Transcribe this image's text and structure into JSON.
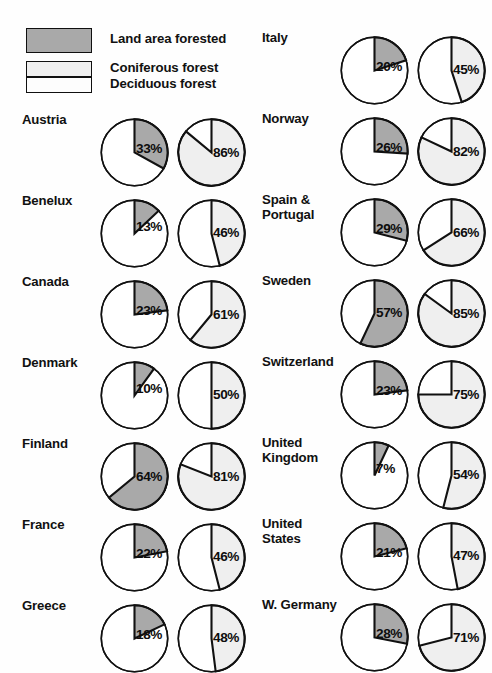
{
  "legend": {
    "items": [
      {
        "key": "land_area_forested",
        "label": "Land area forested",
        "swatch": "shaded-gray",
        "color": "#a9a9a9"
      },
      {
        "key": "coniferous_forest",
        "label": "Coniferous forest",
        "swatch": "light-gray",
        "color": "#efefef"
      },
      {
        "key": "deciduous_forest",
        "label": "Deciduous forest",
        "swatch": "white",
        "color": "#ffffff"
      }
    ]
  },
  "chart_data": {
    "type": "pie",
    "title": "",
    "series": [
      {
        "name": "Land area forested",
        "color": "#a9a9a9"
      },
      {
        "name": "Coniferous forest",
        "color": "#efefef"
      },
      {
        "name": "Deciduous forest",
        "color": "#ffffff"
      }
    ],
    "legend_position": "top-left",
    "categories": [
      "Austria",
      "Benelux",
      "Canada",
      "Denmark",
      "Finland",
      "France",
      "Greece",
      "Italy",
      "Norway",
      "Spain & Portugal",
      "Sweden",
      "Switzerland",
      "United Kingdom",
      "United States",
      "W. Germany"
    ],
    "land_area_forested_pct": [
      33,
      13,
      23,
      10,
      64,
      22,
      18,
      20,
      26,
      29,
      57,
      23,
      7,
      21,
      28
    ],
    "coniferous_forest_pct": [
      86,
      46,
      61,
      50,
      81,
      46,
      48,
      45,
      82,
      66,
      85,
      75,
      54,
      47,
      71
    ]
  },
  "columns": [
    {
      "column": "left",
      "rows": [
        {
          "label": "Austria",
          "forested": "33%",
          "forested_value": 33,
          "coniferous": "86%",
          "coniferous_value": 86
        },
        {
          "label": "Benelux",
          "forested": "13%",
          "forested_value": 13,
          "coniferous": "46%",
          "coniferous_value": 46
        },
        {
          "label": "Canada",
          "forested": "23%",
          "forested_value": 23,
          "coniferous": "61%",
          "coniferous_value": 61
        },
        {
          "label": "Denmark",
          "forested": "10%",
          "forested_value": 10,
          "coniferous": "50%",
          "coniferous_value": 50
        },
        {
          "label": "Finland",
          "forested": "64%",
          "forested_value": 64,
          "coniferous": "81%",
          "coniferous_value": 81
        },
        {
          "label": "France",
          "forested": "22%",
          "forested_value": 22,
          "coniferous": "46%",
          "coniferous_value": 46
        },
        {
          "label": "Greece",
          "forested": "18%",
          "forested_value": 18,
          "coniferous": "48%",
          "coniferous_value": 48
        }
      ]
    },
    {
      "column": "right",
      "rows": [
        {
          "label": "Italy",
          "forested": "20%",
          "forested_value": 20,
          "coniferous": "45%",
          "coniferous_value": 45
        },
        {
          "label": "Norway",
          "forested": "26%",
          "forested_value": 26,
          "coniferous": "82%",
          "coniferous_value": 82
        },
        {
          "label": "Spain &\nPortugal",
          "forested": "29%",
          "forested_value": 29,
          "coniferous": "66%",
          "coniferous_value": 66
        },
        {
          "label": "Sweden",
          "forested": "57%",
          "forested_value": 57,
          "coniferous": "85%",
          "coniferous_value": 85
        },
        {
          "label": "Switzerland",
          "forested": "23%",
          "forested_value": 23,
          "coniferous": "75%",
          "coniferous_value": 75
        },
        {
          "label": "United\nKingdom",
          "forested": "7%",
          "forested_value": 7,
          "coniferous": "54%",
          "coniferous_value": 54
        },
        {
          "label": "United\nStates",
          "forested": "21%",
          "forested_value": 21,
          "coniferous": "47%",
          "coniferous_value": 47
        },
        {
          "label": "W. Germany",
          "forested": "28%",
          "forested_value": 28,
          "coniferous": "71%",
          "coniferous_value": 71
        }
      ]
    }
  ],
  "layout": {
    "left_column_x": 22,
    "right_column_x": 262,
    "left_first_row_y": 118,
    "right_first_row_y": 36,
    "row_spacing": 81,
    "pie_diameter": 69
  }
}
